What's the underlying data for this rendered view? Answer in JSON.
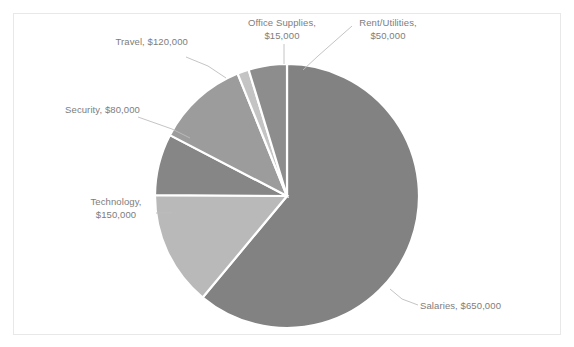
{
  "chart_data": {
    "type": "pie",
    "title": "",
    "subtitle": "",
    "xlabel": "",
    "ylabel": "",
    "legend_position": "none",
    "grid": false,
    "labels_outside": true,
    "currency_prefix": "$",
    "total": 1065000,
    "categories": [
      "Salaries",
      "Technology",
      "Travel",
      "Security",
      "Rent/Utilities",
      "Office Supplies"
    ],
    "values": [
      650000,
      150000,
      120000,
      80000,
      50000,
      15000
    ],
    "value_texts": [
      "$650,000",
      "$150,000",
      "$120,000",
      "$80,000",
      "$50,000",
      "$15,000"
    ],
    "colors": [
      "#828282",
      "#b9b9b9",
      "#9c9c9c",
      "#868686",
      "#8d8d8d",
      "#c4c4c4"
    ],
    "slice_separator_color": "#ffffff",
    "slices": [
      {
        "name": "Salaries",
        "value": 650000,
        "value_text": "$650,000",
        "label": "Salaries, $650,000",
        "color": "#828282",
        "start_angle": 22.0,
        "end_angle": 241.7
      },
      {
        "name": "Technology",
        "value": 150000,
        "value_text": "$150,000",
        "label": "Technology,\n$150,000",
        "color": "#b9b9b9",
        "start_angle": 241.7,
        "end_angle": 292.4
      },
      {
        "name": "Security",
        "value": 80000,
        "value_text": "$80,000",
        "label": "Security, $80,000",
        "color": "#868686",
        "start_angle": 292.4,
        "end_angle": 319.4
      },
      {
        "name": "Travel",
        "value": 120000,
        "value_text": "$120,000",
        "label": "Travel, $120,000",
        "color": "#9c9c9c",
        "start_angle": 319.4,
        "end_angle": 360.0
      },
      {
        "name": "Office Supplies",
        "value": 15000,
        "value_text": "$15,000",
        "label": "Office Supplies,\n$15,000",
        "color": "#c4c4c4",
        "start_angle": 0.0,
        "end_angle": 5.1
      },
      {
        "name": "Rent/Utilities",
        "value": 50000,
        "value_text": "$50,000",
        "label": "Rent/Utilities,\n$50,000",
        "color": "#8d8d8d",
        "start_angle": 5.1,
        "end_angle": 22.0
      }
    ]
  },
  "labels": {
    "office_supplies": "Office Supplies,\n$15,000",
    "rent_utilities": "Rent/Utilities,\n$50,000",
    "travel": "Travel, $120,000",
    "security": "Security, $80,000",
    "technology": "Technology,\n$150,000",
    "salaries": "Salaries, $650,000"
  },
  "frame": {
    "border_color": "#e8e8e8",
    "background_color": "#ffffff"
  },
  "geometry": {
    "center_x": 287,
    "center_y": 196,
    "radius": 132
  }
}
